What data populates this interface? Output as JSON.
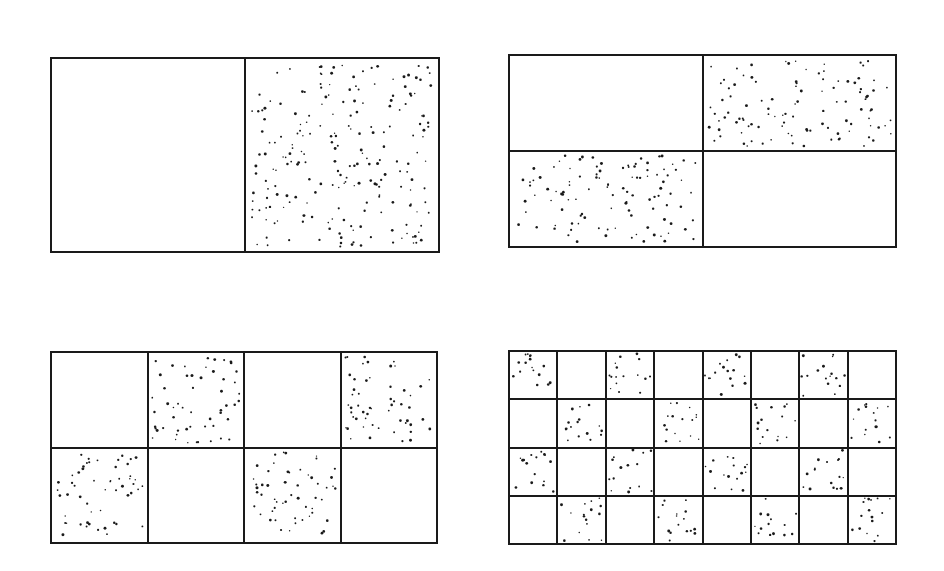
{
  "figure": {
    "background_color": "#ffffff",
    "ink_color": "#1a1a1a",
    "stipple_color": "#1a1a1a",
    "border_width_px": 2,
    "divider_width_px": 2
  },
  "chart_data": {
    "type": "diagram",
    "xlabel": "",
    "ylabel": "",
    "grid": true,
    "legend": "none",
    "panel_count": 4,
    "panels": [
      {
        "id": "panel-a",
        "label": "a",
        "position": "top-left",
        "columns": 2,
        "rows": 1,
        "cell_count": 2,
        "filled_cell_count": 1,
        "empty_cell_count": 1,
        "fill_fraction": 0.5,
        "dots_per_filled_cell": 215,
        "dot_radius_px": 1.1,
        "pattern_start": "empty",
        "fill_grid": [
          [
            0,
            1
          ]
        ]
      },
      {
        "id": "panel-b",
        "label": "b",
        "position": "top-right",
        "columns": 2,
        "rows": 2,
        "cell_count": 4,
        "filled_cell_count": 2,
        "empty_cell_count": 2,
        "fill_fraction": 0.5,
        "dots_per_filled_cell": 108,
        "dot_radius_px": 1.1,
        "pattern_start": "empty",
        "fill_grid": [
          [
            0,
            1
          ],
          [
            1,
            0
          ]
        ]
      },
      {
        "id": "panel-c",
        "label": "c",
        "position": "bottom-left",
        "columns": 4,
        "rows": 2,
        "cell_count": 8,
        "filled_cell_count": 4,
        "empty_cell_count": 4,
        "fill_fraction": 0.5,
        "dots_per_filled_cell": 54,
        "dot_radius_px": 1.1,
        "pattern_start": "empty",
        "fill_grid": [
          [
            0,
            1,
            0,
            1
          ],
          [
            1,
            0,
            1,
            0
          ]
        ]
      },
      {
        "id": "panel-d",
        "label": "d",
        "position": "bottom-right",
        "columns": 8,
        "rows": 4,
        "cell_count": 32,
        "filled_cell_count": 16,
        "empty_cell_count": 16,
        "fill_fraction": 0.5,
        "dots_per_filled_cell": 16,
        "dot_radius_px": 1.1,
        "pattern_start": "filled",
        "fill_grid": [
          [
            1,
            0,
            1,
            0,
            1,
            0,
            1,
            0
          ],
          [
            0,
            1,
            0,
            1,
            0,
            1,
            0,
            1
          ],
          [
            1,
            0,
            1,
            0,
            1,
            0,
            1,
            0
          ],
          [
            0,
            1,
            0,
            1,
            0,
            1,
            0,
            1
          ]
        ]
      }
    ]
  }
}
